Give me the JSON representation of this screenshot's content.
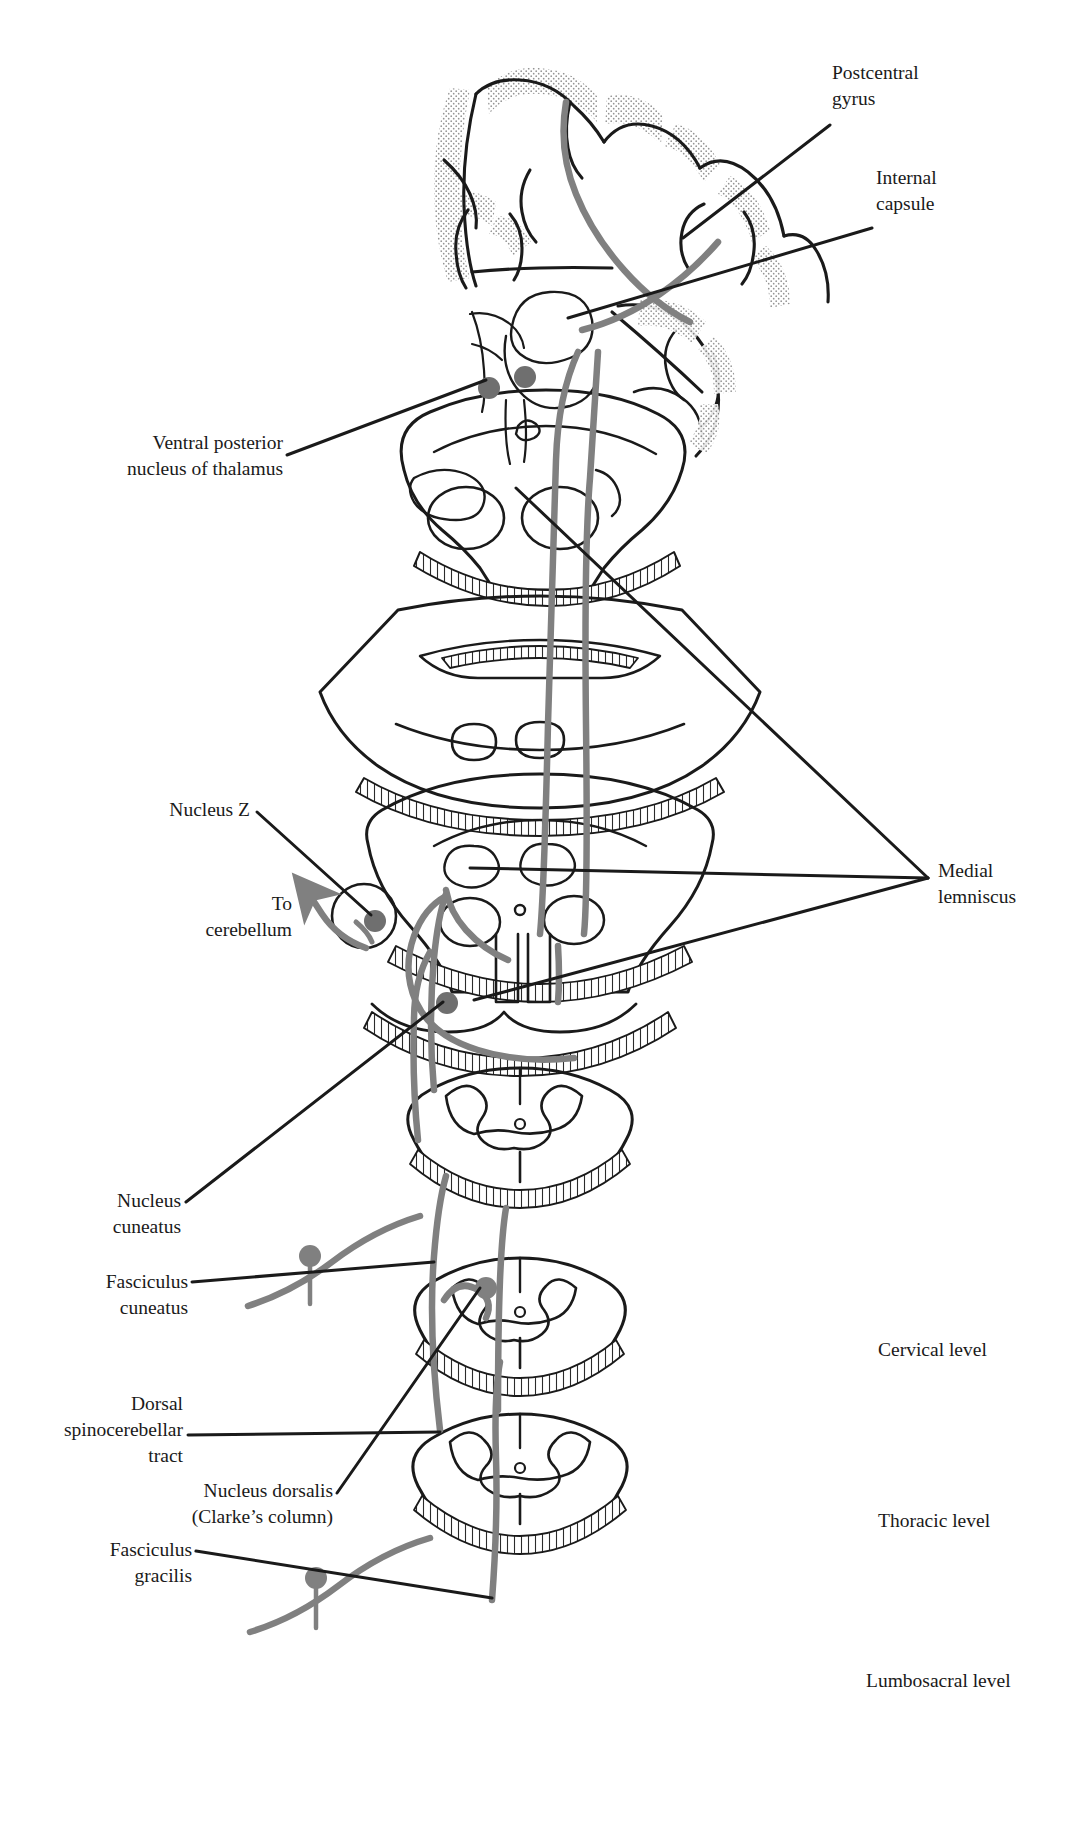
{
  "figure": {
    "type": "anatomical-diagram",
    "width": 1078,
    "height": 1842,
    "background": "#ffffff",
    "ink": "#1a1a1a",
    "tract_gray": "#808080",
    "stipple": "#b9b9b9"
  },
  "labels": {
    "postcentral_gyrus": "Postcentral\ngyrus",
    "internal_capsule": "Internal\ncapsule",
    "ventral_posterior_nucleus": "Ventral posterior\nnucleus of thalamus",
    "nucleus_z": "Nucleus Z",
    "to_cerebellum": "To\ncerebellum",
    "medial_lemniscus": "Medial\nlemniscus",
    "nucleus_cuneatus": "Nucleus\ncuneatus",
    "fasciculus_cuneatus": "Fasciculus\ncuneatus",
    "dorsal_spinocerebellar_tract": "Dorsal\nspinocerebellar\ntract",
    "nucleus_dorsalis": "Nucleus dorsalis\n(Clarke’s column)",
    "fasciculus_gracilis": "Fasciculus\ngracilis",
    "cervical_level": "Cervical level",
    "thoracic_level": "Thoracic level",
    "lumbosacral_level": "Lumbosacral level"
  },
  "sections": [
    {
      "name": "cerebral-hemisphere-section",
      "level": "Forebrain / cerebral cortex"
    },
    {
      "name": "midbrain-section",
      "level": "Midbrain"
    },
    {
      "name": "pons-section",
      "level": "Pons"
    },
    {
      "name": "medulla-section",
      "level": "Medulla"
    },
    {
      "name": "spinal-cord-cervical",
      "level": "Cervical level"
    },
    {
      "name": "spinal-cord-thoracic",
      "level": "Thoracic level"
    },
    {
      "name": "spinal-cord-lumbosacral",
      "level": "Lumbosacral level"
    }
  ]
}
